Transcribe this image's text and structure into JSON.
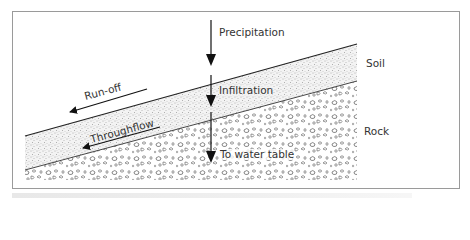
{
  "diagram": {
    "layers": [
      {
        "name": "soil",
        "label": "Soil"
      },
      {
        "name": "rock",
        "label": "Rock"
      }
    ],
    "flows": [
      {
        "name": "precipitation",
        "label": "Precipitation",
        "direction": "down"
      },
      {
        "name": "infiltration",
        "label": "Infiltration",
        "direction": "down"
      },
      {
        "name": "to-water-table",
        "label": "To water table",
        "direction": "down"
      },
      {
        "name": "run-off",
        "label": "Run-off",
        "direction": "downslope-left"
      },
      {
        "name": "throughflow",
        "label": "Throughflow",
        "direction": "downslope-left"
      }
    ],
    "colors": {
      "line": "#222222",
      "frame": "#9a9a9a",
      "stipple": "#6a6a6a",
      "pebble": "#555555"
    }
  }
}
